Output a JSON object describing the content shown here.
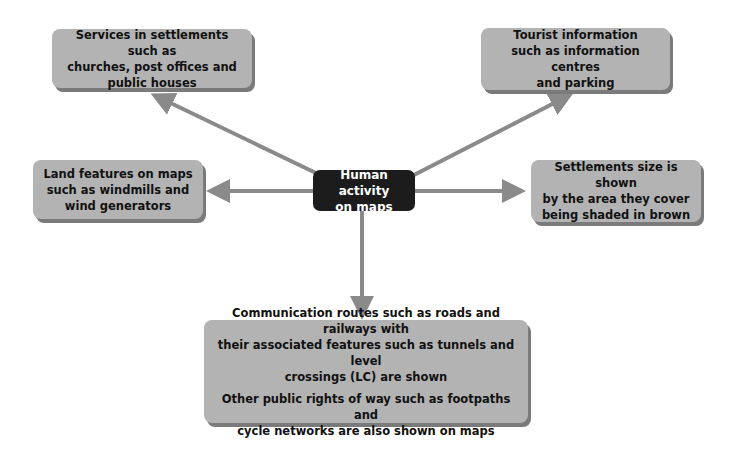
{
  "diagram": {
    "center": {
      "lines": [
        "Human activity",
        "on maps"
      ]
    },
    "nodes": [
      {
        "id": "services",
        "lines": [
          "Services in settlements such as",
          "churches, post offices and",
          "public houses"
        ]
      },
      {
        "id": "tourist",
        "lines": [
          "Tourist information",
          "such as information centres",
          "and parking"
        ]
      },
      {
        "id": "land",
        "lines": [
          "Land features on maps",
          "such as windmills and",
          "wind generators"
        ]
      },
      {
        "id": "settlements",
        "lines": [
          "Settlements size is shown",
          "by the area they cover",
          "being shaded in brown"
        ]
      },
      {
        "id": "communication",
        "para1": [
          "Communication routes such as roads and railways with",
          "their associated features such as tunnels and level",
          "crossings (LC) are shown"
        ],
        "para2": [
          "Other public rights of way such as footpaths and",
          "cycle networks are also shown on maps"
        ]
      }
    ],
    "colors": {
      "box": "#b3b3b3",
      "shadow": "#7a7a7a",
      "center": "#1c1c1c",
      "arrow": "#8a8a8a"
    }
  }
}
